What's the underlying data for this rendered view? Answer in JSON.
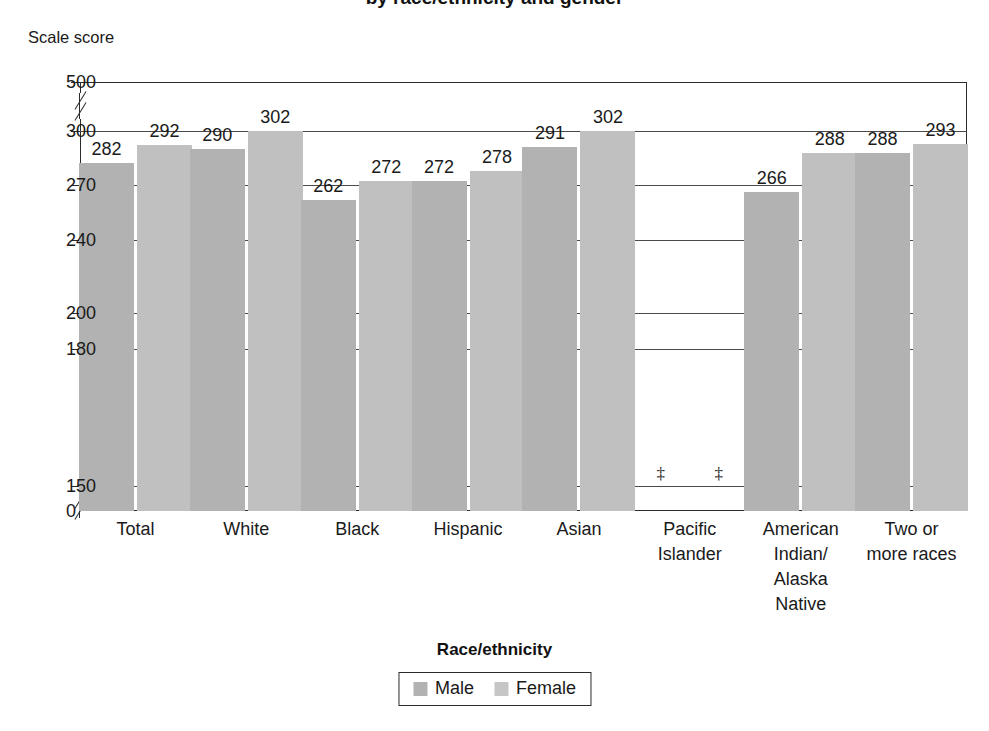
{
  "chart_data": {
    "type": "bar",
    "title": "by race/ethnicity and gender",
    "ylabel": "Scale score",
    "xlabel": "Race/ethnicity",
    "categories": [
      "Total",
      "White",
      "Black",
      "Hispanic",
      "Asian",
      "Pacific\nIslander",
      "American\nIndian/\nAlaska\nNative",
      "Two or\nmore races"
    ],
    "category_lines": [
      [
        "Total"
      ],
      [
        "White"
      ],
      [
        "Black"
      ],
      [
        "Hispanic"
      ],
      [
        "Asian"
      ],
      [
        "Pacific",
        "Islander"
      ],
      [
        "American",
        "Indian/",
        "Alaska",
        "Native"
      ],
      [
        "Two or",
        "more races"
      ]
    ],
    "series": [
      {
        "name": "Male",
        "color": "#b2b2b2",
        "values": [
          282,
          290,
          262,
          272,
          291,
          null,
          266,
          288
        ]
      },
      {
        "name": "Female",
        "color": "#c0c0c0",
        "values": [
          292,
          302,
          272,
          278,
          302,
          null,
          288,
          293
        ]
      }
    ],
    "suppressed_marker": "‡",
    "suppressed_categories": [
      "Pacific Islander"
    ],
    "ytick_labels": [
      "500",
      "300",
      "270",
      "240",
      "200",
      "180",
      "150",
      "0"
    ],
    "ytick_values": [
      500,
      300,
      270,
      240,
      200,
      180,
      150,
      0
    ],
    "ylim": [
      0,
      500
    ],
    "axis_breaks": [
      [
        150,
        300
      ],
      [
        0,
        150
      ]
    ],
    "grid": true,
    "legend_position": "bottom-center",
    "legend_entries": [
      "Male",
      "Female"
    ]
  }
}
